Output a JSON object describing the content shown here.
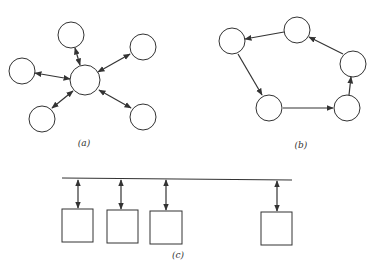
{
  "figure": {
    "panels": [
      {
        "id": "a",
        "label": "(a)",
        "topology": "star",
        "description": "Central node with bidirectional links to 5 peripheral nodes"
      },
      {
        "id": "b",
        "label": "(b)",
        "topology": "ring",
        "description": "Five nodes connected in a directed ring"
      },
      {
        "id": "c",
        "label": "(c)",
        "topology": "bus",
        "description": "Four stations with bidirectional links to a shared bus line"
      }
    ]
  },
  "colors": {
    "stroke": "#333333",
    "fill": "#ffffff"
  }
}
